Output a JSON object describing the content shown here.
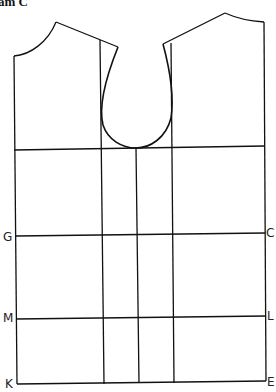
{
  "title": "am C",
  "labels": {
    "G": "G",
    "C": "C",
    "M": "M",
    "L": "L",
    "K": "K",
    "E": "E"
  },
  "colors": {
    "line": "#111111",
    "background": "#ffffff"
  }
}
